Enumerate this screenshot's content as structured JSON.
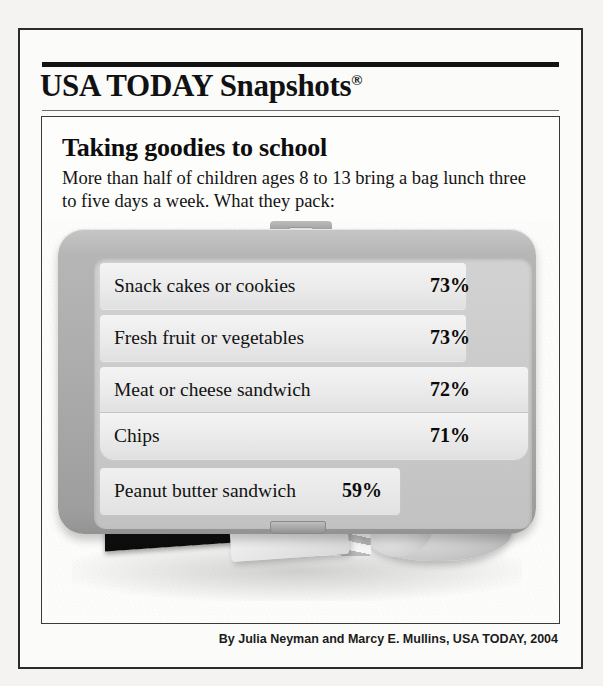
{
  "masthead": {
    "brand": "USA TODAY Snapshots",
    "registered_mark": "®"
  },
  "headline": "Taking goodies to school",
  "subhead": "More than half of children ages 8 to 13 bring a bag lunch three to five days a week. What they pack:",
  "illustration": {
    "lunchbox_label": "lunchbox",
    "milk_carton_text": "MILK",
    "items": [
      "milk-carton",
      "sandwich-bag",
      "apple"
    ]
  },
  "source": "Source: Impulse Research for the American Dietetic Association/ConAgra Foods",
  "byline": "By Julia Neyman and Marcy E. Mullins, USA TODAY, 2004",
  "colors": {
    "page_background": "#f4f3f1",
    "frame": "#2b2b2b",
    "lunchbox_body": "#ababab",
    "row_fill": "#ececec",
    "text": "#111111"
  },
  "chart_data": {
    "type": "bar",
    "title": "Taking goodies to school",
    "subtitle": "More than half of children ages 8 to 13 bring a bag lunch three to five days a week. What they pack:",
    "xlabel": "",
    "ylabel": "",
    "unit": "%",
    "xlim": [
      0,
      100
    ],
    "grid": false,
    "legend": false,
    "categories": [
      "Snack cakes or cookies",
      "Fresh fruit or vegetables",
      "Meat or cheese sandwich",
      "Chips",
      "Peanut butter sandwich"
    ],
    "values": [
      73,
      73,
      72,
      71,
      59
    ],
    "value_labels": [
      "73%",
      "73%",
      "72%",
      "71%",
      "59%"
    ],
    "source": "Impulse Research for the American Dietetic Association/ConAgra Foods",
    "credit": "By Julia Neyman and Marcy E. Mullins, USA TODAY, 2004"
  }
}
